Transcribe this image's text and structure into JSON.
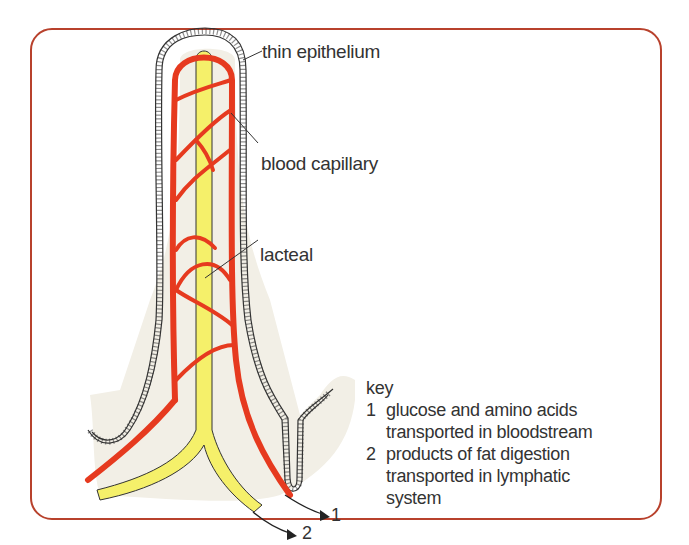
{
  "figure": {
    "colors": {
      "frame_border": "#b8412c",
      "blood_capillary": "#e63a1f",
      "lacteal": "#f5f06a",
      "tissue_fill": "#f2efe6",
      "outline": "#333333"
    }
  },
  "labels": {
    "thin_epithelium": "thin epithelium",
    "blood_capillary": "blood capillary",
    "lacteal": "lacteal"
  },
  "key": {
    "heading": "key",
    "items": [
      {
        "number": "1",
        "line1": "glucose and amino acids",
        "line2": "transported in bloodstream"
      },
      {
        "number": "2",
        "line1": "products of fat digestion",
        "line2": "transported in lymphatic",
        "line3": "system"
      }
    ]
  },
  "arrows": {
    "arrow1_label": "1",
    "arrow2_label": "2"
  }
}
